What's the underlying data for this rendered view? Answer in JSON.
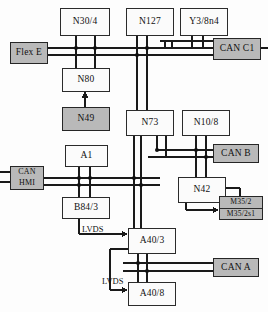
{
  "diagram": {
    "nodes": [
      {
        "id": "n30_4",
        "label": "N30/4",
        "style": "plain"
      },
      {
        "id": "n127",
        "label": "N127",
        "style": "plain"
      },
      {
        "id": "y3_8n4",
        "label": "Y3/8n4",
        "style": "plain"
      },
      {
        "id": "flex_e",
        "label": "Flex E",
        "style": "gray"
      },
      {
        "id": "can_c1",
        "label": "CAN C1",
        "style": "gray"
      },
      {
        "id": "n80",
        "label": "N80",
        "style": "plain"
      },
      {
        "id": "n49",
        "label": "N49",
        "style": "gray"
      },
      {
        "id": "n73",
        "label": "N73",
        "style": "plain"
      },
      {
        "id": "n10_8",
        "label": "N10/8",
        "style": "plain"
      },
      {
        "id": "can_b",
        "label": "CAN B",
        "style": "gray"
      },
      {
        "id": "a1",
        "label": "A1",
        "style": "plain"
      },
      {
        "id": "can_hmi",
        "label": "CAN\nHMI",
        "style": "gray"
      },
      {
        "id": "n42",
        "label": "N42",
        "style": "plain"
      },
      {
        "id": "m35",
        "label_top": "M35/2",
        "label_bottom": "M35/2s1",
        "style": "gray"
      },
      {
        "id": "b84_3",
        "label": "B84/3",
        "style": "plain"
      },
      {
        "id": "a40_3",
        "label": "A40/3",
        "style": "plain"
      },
      {
        "id": "can_a",
        "label": "CAN A",
        "style": "gray"
      },
      {
        "id": "a40_8",
        "label": "A40/8",
        "style": "plain"
      }
    ],
    "link_labels": {
      "lvds_b84_to_a40_3": "LVDS",
      "lvds_a40_3_to_a40_8": "LVDS"
    },
    "colors": {
      "line": "#1a1a1a",
      "box_fill": "#fbfbfb",
      "box_fill_gray": "#b9b9b9",
      "border": "#2b2b2b"
    }
  }
}
